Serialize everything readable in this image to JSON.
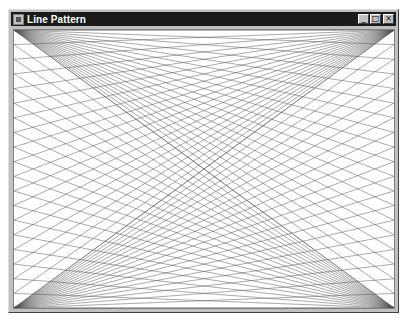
{
  "window": {
    "title": "Line Pattern",
    "icon": "app-icon",
    "buttons": [
      {
        "name": "minimize-button",
        "glyph": "_"
      },
      {
        "name": "maximize-button",
        "glyph": "□"
      },
      {
        "name": "close-button",
        "glyph": "×"
      }
    ]
  },
  "pattern": {
    "description": "Line fans from each client corner to evenly spaced points on the opposite vertical edge",
    "divisions": 19,
    "line_color": "#555555",
    "line_width": 0.5,
    "fans": [
      {
        "from": "top-left",
        "to_edge": "right"
      },
      {
        "from": "top-right",
        "to_edge": "left"
      },
      {
        "from": "bottom-left",
        "to_edge": "right"
      },
      {
        "from": "bottom-right",
        "to_edge": "left"
      }
    ]
  }
}
